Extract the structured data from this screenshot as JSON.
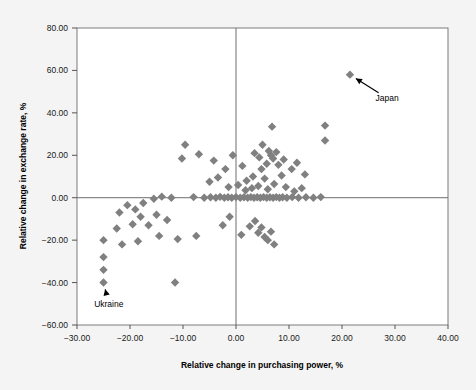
{
  "chart_data": {
    "type": "scatter",
    "title": "",
    "xlabel": "Relative change in purchasing power, %",
    "ylabel": "Relative change in exchange rate, %",
    "xlim": [
      -30,
      40
    ],
    "ylim": [
      -60,
      80
    ],
    "xticks": [
      -30,
      -20,
      -10,
      0,
      10,
      20,
      30,
      40
    ],
    "yticks": [
      -60,
      -40,
      -20,
      0,
      20,
      40,
      60,
      80
    ],
    "xtick_labels": [
      "−30.00",
      "−20.00",
      "−10.00",
      "0.00",
      "10.00",
      "20.00",
      "30.00",
      "40.00"
    ],
    "ytick_labels": [
      "−60.00",
      "−40.00",
      "−20.00",
      "0.00",
      "20.00",
      "40.00",
      "60.00",
      "80.00"
    ],
    "grid": false,
    "legend": "none",
    "marker": "diamond",
    "marker_color": "#808080",
    "series": [
      {
        "name": "countries",
        "points": [
          [
            21.5,
            58.0
          ],
          [
            16.8,
            34.0
          ],
          [
            16.8,
            27.0
          ],
          [
            6.8,
            33.5
          ],
          [
            5.0,
            25.0
          ],
          [
            -9.6,
            25.0
          ],
          [
            -7.0,
            20.5
          ],
          [
            -10.2,
            18.5
          ],
          [
            -4.2,
            17.5
          ],
          [
            -2.0,
            13.5
          ],
          [
            -0.6,
            20.0
          ],
          [
            1.2,
            15.0
          ],
          [
            3.5,
            21.0
          ],
          [
            4.4,
            19.0
          ],
          [
            6.2,
            22.0
          ],
          [
            6.6,
            20.0
          ],
          [
            7.0,
            18.5
          ],
          [
            7.6,
            21.5
          ],
          [
            8.0,
            15.5
          ],
          [
            9.0,
            18.0
          ],
          [
            10.5,
            13.5
          ],
          [
            11.5,
            16.5
          ],
          [
            13.0,
            11.0
          ],
          [
            5.8,
            16.0
          ],
          [
            4.8,
            13.5
          ],
          [
            3.2,
            10.0
          ],
          [
            2.0,
            8.0
          ],
          [
            5.4,
            9.0
          ],
          [
            8.6,
            10.5
          ],
          [
            -3.4,
            9.5
          ],
          [
            -5.0,
            7.5
          ],
          [
            -1.4,
            5.0
          ],
          [
            0.4,
            6.0
          ],
          [
            1.8,
            3.5
          ],
          [
            3.0,
            4.5
          ],
          [
            4.2,
            5.5
          ],
          [
            6.0,
            4.0
          ],
          [
            7.2,
            6.5
          ],
          [
            9.4,
            5.0
          ],
          [
            11.0,
            3.0
          ],
          [
            12.4,
            4.5
          ],
          [
            -14.0,
            0.5
          ],
          [
            -12.2,
            0.0
          ],
          [
            -8.0,
            0.3
          ],
          [
            -6.0,
            0.0
          ],
          [
            -4.8,
            0.2
          ],
          [
            -3.8,
            0.0
          ],
          [
            -3.0,
            0.4
          ],
          [
            -2.2,
            0.0
          ],
          [
            -1.5,
            0.2
          ],
          [
            -0.8,
            0.0
          ],
          [
            0.0,
            0.3
          ],
          [
            0.8,
            0.0
          ],
          [
            1.5,
            0.2
          ],
          [
            2.2,
            0.0
          ],
          [
            2.8,
            0.3
          ],
          [
            3.4,
            0.0
          ],
          [
            4.0,
            0.2
          ],
          [
            4.6,
            0.0
          ],
          [
            5.2,
            0.3
          ],
          [
            5.8,
            0.0
          ],
          [
            6.4,
            0.2
          ],
          [
            7.0,
            0.0
          ],
          [
            7.6,
            0.3
          ],
          [
            8.2,
            0.0
          ],
          [
            8.8,
            0.2
          ],
          [
            9.6,
            0.0
          ],
          [
            10.6,
            0.3
          ],
          [
            11.8,
            0.0
          ],
          [
            13.2,
            0.2
          ],
          [
            14.6,
            0.0
          ],
          [
            16.0,
            0.3
          ],
          [
            -15.5,
            -0.5
          ],
          [
            -17.5,
            -2.5
          ],
          [
            -20.5,
            -3.5
          ],
          [
            -19.0,
            -5.5
          ],
          [
            -22.0,
            -7.0
          ],
          [
            -18.0,
            -9.0
          ],
          [
            -15.0,
            -8.0
          ],
          [
            -13.0,
            -10.5
          ],
          [
            -16.5,
            -13.0
          ],
          [
            -19.5,
            -12.5
          ],
          [
            -22.5,
            -14.5
          ],
          [
            -25.0,
            -20.0
          ],
          [
            -25.0,
            -28.0
          ],
          [
            -25.0,
            -34.0
          ],
          [
            -25.0,
            -40.0
          ],
          [
            -21.5,
            -22.0
          ],
          [
            -18.5,
            -20.5
          ],
          [
            -14.5,
            -18.0
          ],
          [
            -11.0,
            -19.5
          ],
          [
            -11.5,
            -40.0
          ],
          [
            -2.5,
            -13.0
          ],
          [
            -1.2,
            -9.0
          ],
          [
            1.0,
            -17.5
          ],
          [
            2.6,
            -13.5
          ],
          [
            3.6,
            -11.0
          ],
          [
            4.2,
            -16.5
          ],
          [
            4.8,
            -14.0
          ],
          [
            5.4,
            -18.5
          ],
          [
            6.0,
            -20.0
          ],
          [
            6.6,
            -16.0
          ],
          [
            7.2,
            -22.0
          ],
          [
            -7.5,
            -18.0
          ]
        ]
      }
    ],
    "annotations": [
      {
        "label": "Japan",
        "point": [
          21.5,
          58.0
        ],
        "label_x": 28.5,
        "label_y": 47.0
      },
      {
        "label": "Ukraine",
        "point": [
          -25.0,
          -40.0
        ],
        "label_x": -24.0,
        "label_y": -50.0
      }
    ]
  }
}
